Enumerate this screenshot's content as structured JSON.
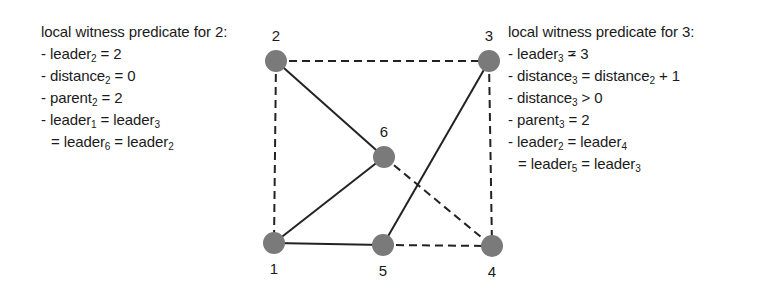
{
  "figure": {
    "type": "graph-diagram",
    "colors": {
      "node_fill": "#7a7a7a",
      "solid_edge": "#222222",
      "dashed_edge": "#222222",
      "text": "#1a1a1a",
      "background": "#ffffff"
    }
  },
  "left_panel": {
    "title": "local witness predicate for 2:",
    "lines": [
      {
        "prefix": "- leader",
        "sub": "2",
        "suffix": " = 2"
      },
      {
        "prefix": "- distance",
        "sub": "2",
        "suffix": " = 0"
      },
      {
        "prefix": "- parent",
        "sub": "2",
        "suffix": " = 2"
      },
      {
        "prefix": "- leader",
        "sub": "1",
        "mid": " = leader",
        "sub2": "3",
        "suffix": ""
      },
      {
        "prefix": "= leader",
        "sub": "6",
        "mid": " = leader",
        "sub2": "2",
        "suffix": ""
      }
    ]
  },
  "right_panel": {
    "title": "local witness predicate for 3:",
    "lines": [
      {
        "prefix": "- leader",
        "sub": "3",
        "op": "=",
        "suffix": " 3",
        "note": "not-equal (struck equals)"
      },
      {
        "prefix": "- distance",
        "sub": "3",
        "mid": " = distance",
        "sub2": "2",
        "suffix": " + 1"
      },
      {
        "prefix": "- distance",
        "sub": "3",
        "suffix": " > 0"
      },
      {
        "prefix": "- parent",
        "sub": "3",
        "suffix": " = 2"
      },
      {
        "prefix": "- leader",
        "sub": "2",
        "mid": " = leader",
        "sub2": "4",
        "suffix": ""
      },
      {
        "prefix": "= leader",
        "sub": "5",
        "mid": " = leader",
        "sub2": "3",
        "suffix": ""
      }
    ]
  },
  "graph": {
    "nodes": [
      {
        "id": "1",
        "label": "1",
        "x": 274,
        "y": 243
      },
      {
        "id": "2",
        "label": "2",
        "x": 276,
        "y": 61
      },
      {
        "id": "3",
        "label": "3",
        "x": 489,
        "y": 61
      },
      {
        "id": "4",
        "label": "4",
        "x": 492,
        "y": 246
      },
      {
        "id": "5",
        "label": "5",
        "x": 383,
        "y": 245
      },
      {
        "id": "6",
        "label": "6",
        "x": 384,
        "y": 157
      }
    ],
    "edges": [
      {
        "from": "2",
        "to": "6",
        "style": "solid"
      },
      {
        "from": "6",
        "to": "1",
        "style": "solid"
      },
      {
        "from": "1",
        "to": "5",
        "style": "solid"
      },
      {
        "from": "5",
        "to": "3",
        "style": "solid"
      },
      {
        "from": "2",
        "to": "3",
        "style": "dashed"
      },
      {
        "from": "2",
        "to": "1",
        "style": "dashed"
      },
      {
        "from": "3",
        "to": "4",
        "style": "dashed"
      },
      {
        "from": "6",
        "to": "4",
        "style": "dashed"
      },
      {
        "from": "5",
        "to": "4",
        "style": "dashed"
      }
    ]
  }
}
